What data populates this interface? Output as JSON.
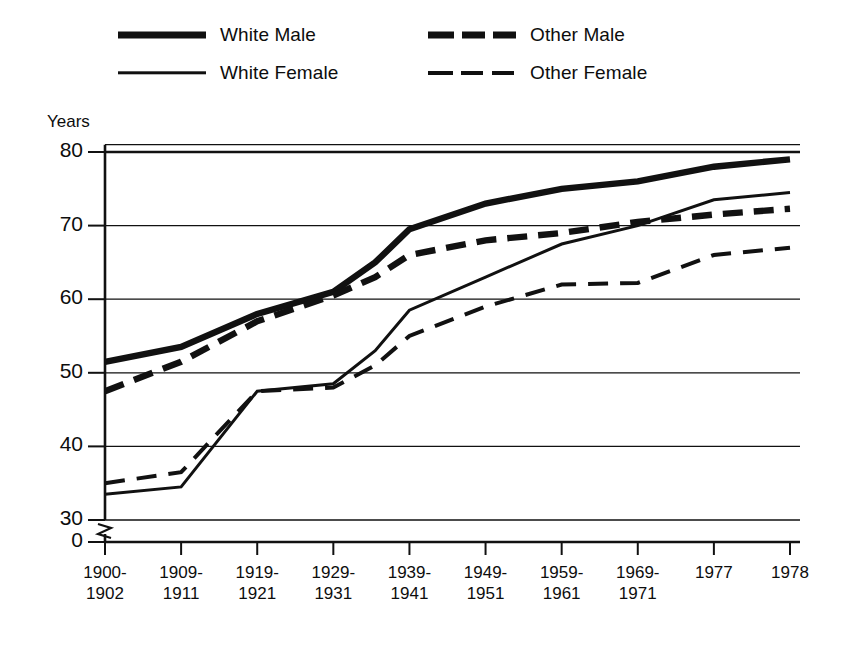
{
  "legend": {
    "items": [
      {
        "key": "white_male",
        "label": "White Male",
        "style": "thick-solid"
      },
      {
        "key": "white_female",
        "label": "White Female",
        "style": "thin-solid"
      },
      {
        "key": "other_male",
        "label": "Other Male",
        "style": "thick-dash"
      },
      {
        "key": "other_female",
        "label": "Other Female",
        "style": "thin-dash"
      }
    ]
  },
  "axis": {
    "y_title": "Years",
    "y_ticks": [
      "80",
      "70",
      "60",
      "50",
      "40",
      "30",
      "0"
    ],
    "x_ticks": [
      {
        "line1": "1900-",
        "line2": "1902"
      },
      {
        "line1": "1909-",
        "line2": "1911"
      },
      {
        "line1": "1919-",
        "line2": "1921"
      },
      {
        "line1": "1929-",
        "line2": "1931"
      },
      {
        "line1": "1939-",
        "line2": "1941"
      },
      {
        "line1": "1949-",
        "line2": "1951"
      },
      {
        "line1": "1959-",
        "line2": "1961"
      },
      {
        "line1": "1969-",
        "line2": "1971"
      },
      {
        "line1": "1977",
        "line2": ""
      },
      {
        "line1": "1978",
        "line2": ""
      }
    ]
  },
  "chart_data": {
    "type": "line",
    "title": "",
    "xlabel": "",
    "ylabel": "Years",
    "ylim": [
      30,
      81
    ],
    "y_axis_break": true,
    "y_break_note": "axis broken between 0 and 30",
    "grid": "horizontal",
    "legend_position": "top",
    "categories": [
      "1900-1902",
      "1909-1911",
      "1919-1921",
      "1929-1931",
      "1939-1941",
      "1949-1951",
      "1959-1961",
      "1969-1971",
      "1977",
      "1978"
    ],
    "series": [
      {
        "name": "White Male",
        "style": "thick-solid",
        "values": [
          51.5,
          53.5,
          58.0,
          61.0,
          65.0,
          69.5,
          73.0,
          75.0,
          76.0,
          78.0,
          79.0
        ],
        "x_values": [
          "1900-1902",
          "1909-1911",
          "1919-1921",
          "1929-1931",
          "1934",
          "1939-1941",
          "1949-1951",
          "1959-1961",
          "1969-1971",
          "1977",
          "1978"
        ]
      },
      {
        "name": "White Female",
        "style": "thin-solid",
        "values": [
          33.5,
          34.5,
          47.5,
          48.5,
          53.0,
          58.5,
          63.0,
          67.5,
          70.0,
          73.5,
          74.5
        ],
        "x_values": [
          "1900-1902",
          "1909-1911",
          "1919-1921",
          "1929-1931",
          "1934",
          "1939-1941",
          "1949-1951",
          "1959-1961",
          "1969-1971",
          "1977",
          "1978"
        ]
      },
      {
        "name": "Other Male",
        "style": "thick-dash",
        "values": [
          47.5,
          51.5,
          57.0,
          60.5,
          63.0,
          66.0,
          68.0,
          69.0,
          70.5,
          71.5,
          72.3
        ],
        "x_values": [
          "1900-1902",
          "1909-1911",
          "1919-1921",
          "1929-1931",
          "1934",
          "1939-1941",
          "1949-1951",
          "1959-1961",
          "1969-1971",
          "1977",
          "1978"
        ]
      },
      {
        "name": "Other Female",
        "style": "thin-dash",
        "values": [
          35.0,
          36.5,
          47.5,
          48.0,
          51.0,
          55.0,
          59.0,
          62.0,
          62.2,
          66.0,
          67.0
        ],
        "x_values": [
          "1900-1902",
          "1909-1911",
          "1919-1921",
          "1929-1931",
          "1934",
          "1939-1941",
          "1949-1951",
          "1959-1961",
          "1969-1971",
          "1977",
          "1978"
        ]
      }
    ]
  }
}
